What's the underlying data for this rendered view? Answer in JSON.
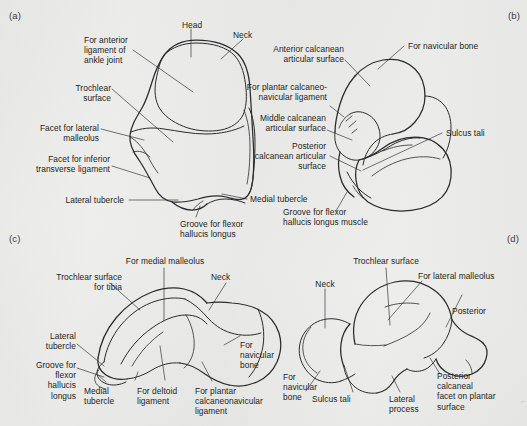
{
  "figure": {
    "background_color": "#ececeb",
    "ink_color": "#2b2b2b"
  },
  "panels": [
    {
      "tag": "(a)",
      "view": "superior-view-talus",
      "labels": [
        {
          "name": "head",
          "text": "Head"
        },
        {
          "name": "neck",
          "text": "Neck"
        },
        {
          "name": "anterior-ligament",
          "text": "For anterior\nligament of\nankle joint"
        },
        {
          "name": "trochlear-surface",
          "text": "Trochlear\nsurface"
        },
        {
          "name": "facet-lateral-malleolus",
          "text": "Facet for lateral\nmalleolus"
        },
        {
          "name": "facet-inferior-transverse",
          "text": "Facet for inferior\ntransverse ligament"
        },
        {
          "name": "lateral-tubercle",
          "text": "Lateral tubercle"
        },
        {
          "name": "medial-tubercle",
          "text": "Medial tubercle"
        },
        {
          "name": "groove-flexor-hallucis",
          "text": "Groove for flexor\nhallucis longus"
        }
      ]
    },
    {
      "tag": "(b)",
      "view": "inferior-view-talus",
      "labels": [
        {
          "name": "anterior-calcanean-surface",
          "text": "Anterior calcanean\narticular surface"
        },
        {
          "name": "for-navicular-bone",
          "text": "For navicular bone"
        },
        {
          "name": "plantar-calcaneonavicular",
          "text": "For plantar calcaneo-\nnavicular ligament"
        },
        {
          "name": "middle-calcanean-surface",
          "text": "Middle calcanean\narticular surface"
        },
        {
          "name": "posterior-calcanean-surface",
          "text": "Posterior\ncalcanean articular\nsurface"
        },
        {
          "name": "sulcus-tali",
          "text": "Sulcus tali"
        },
        {
          "name": "groove-flexor-hallucis-muscle",
          "text": "Groove for flexor\nhallucis longus muscle"
        }
      ]
    },
    {
      "tag": "(c)",
      "view": "medial-view-talus",
      "labels": [
        {
          "name": "trochlear-surface-tibia",
          "text": "Trochlear surface\nfor tibia"
        },
        {
          "name": "for-medial-malleolus",
          "text": "For medial malleolus"
        },
        {
          "name": "neck",
          "text": "Neck"
        },
        {
          "name": "lateral-tubercle",
          "text": "Lateral\ntubercle"
        },
        {
          "name": "for-navicular-bone",
          "text": "For\nnavicular\nbone"
        },
        {
          "name": "groove-flexor-hallucis",
          "text": "Groove for\nflexor\nhallucis\nlongus"
        },
        {
          "name": "medial-tubercle",
          "text": "Medial\ntubercle"
        },
        {
          "name": "for-deltoid-ligament",
          "text": "For deltoid\nligament"
        },
        {
          "name": "for-plantar-calcaneonavicular",
          "text": "For plantar\ncalcaneonavicular\nligament"
        }
      ]
    },
    {
      "tag": "(d)",
      "view": "lateral-view-talus",
      "labels": [
        {
          "name": "trochlear-surface",
          "text": "Trochlear surface"
        },
        {
          "name": "for-lateral-malleolus",
          "text": "For lateral malleolus"
        },
        {
          "name": "neck",
          "text": "Neck"
        },
        {
          "name": "posterior",
          "text": "Posterior"
        },
        {
          "name": "for-navicular-bone",
          "text": "For\nnavicular\nbone"
        },
        {
          "name": "sulcus-tali",
          "text": "Sulcus tali"
        },
        {
          "name": "lateral-process",
          "text": "Lateral\nprocess"
        },
        {
          "name": "posterior-calcaneal-facet",
          "text": "Posterior\ncalcaneal\nfacet on plantar\nsurface"
        }
      ]
    }
  ]
}
